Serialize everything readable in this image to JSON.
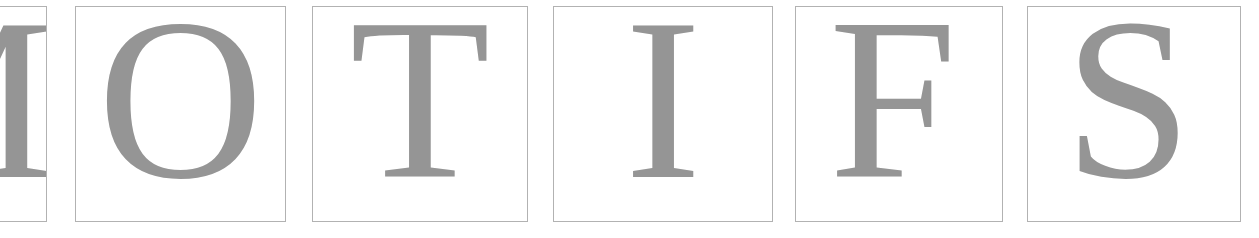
{
  "page": {
    "word": "MOTIFS",
    "canvas": {
      "width": 1259,
      "height": 238
    },
    "background_color": "#ffffff"
  },
  "style": {
    "letter_color": "#959595",
    "tile_border_color": "#b2b2b2",
    "tile_background": "#ffffff",
    "tile_border_width": 1
  },
  "tiles": [
    {
      "id": "tile-1",
      "letter": "M",
      "name": "letter-tile-m",
      "clipped": "left",
      "x": -145,
      "y": 6,
      "width": 192,
      "height": 216,
      "font_size": 230,
      "offset_x": 0,
      "offset_y": -14
    },
    {
      "id": "tile-2",
      "letter": "O",
      "name": "letter-tile-o",
      "clipped": "none",
      "x": 75,
      "y": 6,
      "width": 211,
      "height": 216,
      "font_size": 230,
      "offset_x": 0,
      "offset_y": -14
    },
    {
      "id": "tile-3",
      "letter": "T",
      "name": "letter-tile-t",
      "clipped": "none",
      "x": 312,
      "y": 6,
      "width": 216,
      "height": 216,
      "font_size": 230,
      "offset_x": 0,
      "offset_y": -14
    },
    {
      "id": "tile-4",
      "letter": "I",
      "name": "letter-tile-i",
      "clipped": "none",
      "x": 553,
      "y": 6,
      "width": 220,
      "height": 216,
      "font_size": 230,
      "offset_x": 0,
      "offset_y": -14
    },
    {
      "id": "tile-5",
      "letter": "F",
      "name": "letter-tile-f",
      "clipped": "none",
      "x": 795,
      "y": 6,
      "width": 208,
      "height": 216,
      "font_size": 230,
      "offset_x": -6,
      "offset_y": -14
    },
    {
      "id": "tile-6",
      "letter": "S",
      "name": "letter-tile-s",
      "clipped": "right",
      "x": 1027,
      "y": 6,
      "width": 214,
      "height": 216,
      "font_size": 230,
      "offset_x": -6,
      "offset_y": -14
    }
  ]
}
